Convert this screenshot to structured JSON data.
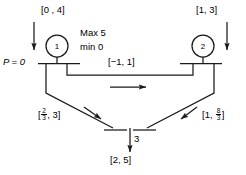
{
  "diagram": {
    "type": "process-flow-network",
    "nodes": [
      {
        "id": "1",
        "label": "1",
        "x": 57,
        "y": 46,
        "r": 11
      },
      {
        "id": "2",
        "label": "2",
        "x": 203,
        "y": 46,
        "r": 11
      }
    ],
    "annotations": {
      "inlet_left_bounds": "[0 , 4]",
      "inlet_right_bounds": "[1, 3]",
      "crossflow_bounds": "[−1, 1]",
      "outlet_bounds": "[2, 5]",
      "outlet_stream_label": "3",
      "pressure_label": "P = 0",
      "capacity_max": "Max 5",
      "capacity_min": "min 0",
      "left_branch_bounds": {
        "open": "[",
        "num": "2",
        "den": "3",
        "rest": ", 3]"
      },
      "right_branch_bounds": {
        "open": "[1, ",
        "num": "8",
        "den": "3",
        "close": "]"
      }
    },
    "colors": {
      "stroke": "#1a1a1a",
      "text": "#000000",
      "background": "#ffffff"
    }
  }
}
